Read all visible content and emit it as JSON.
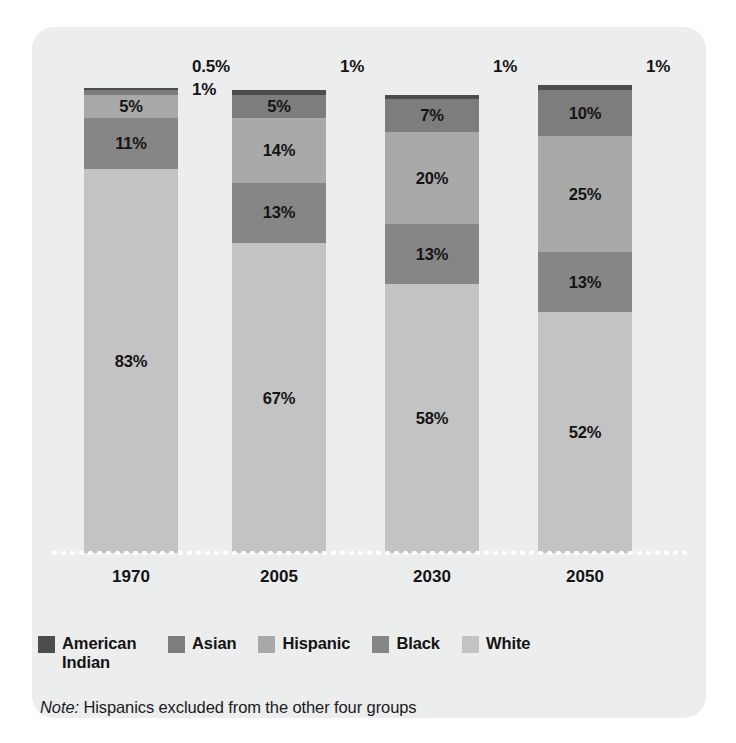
{
  "chart_data": {
    "type": "bar",
    "subtype": "stacked-bar-100-percent",
    "title": "",
    "subtitle": "",
    "xlabel": "",
    "ylabel": "",
    "ylim": [
      0,
      100
    ],
    "grid": false,
    "legend_position": "bottom",
    "categories": [
      "1970",
      "2005",
      "2030",
      "2050"
    ],
    "series": [
      {
        "name": "American Indian",
        "color": "#4c4c4c",
        "values": [
          0.5,
          1,
          1,
          1
        ]
      },
      {
        "name": "Asian",
        "color": "#7d7d7d",
        "values": [
          1,
          5,
          7,
          10
        ]
      },
      {
        "name": "Hispanic",
        "color": "#a9a9a9",
        "values": [
          5,
          14,
          20,
          25
        ]
      },
      {
        "name": "Black",
        "color": "#868686",
        "values": [
          11,
          13,
          13,
          13
        ]
      },
      {
        "name": "White",
        "color": "#c3c3c3",
        "values": [
          83,
          67,
          58,
          52
        ]
      }
    ],
    "note": "Note: Hispanics excluded from the other four groups"
  },
  "colors": {
    "panel_background": "#eceded",
    "page_background": "#ffffff",
    "american_indian": "#4c4c4c",
    "asian": "#7d7d7d",
    "hispanic": "#a9a9a9",
    "black": "#868686",
    "white": "#c3c3c3",
    "text": "#141414",
    "baseline_dots": "#ffffff"
  },
  "bars": [
    {
      "year": "1970",
      "callouts": [
        "0.5%",
        "1%"
      ],
      "segments": [
        {
          "group": "American Indian",
          "value": 0.5,
          "label": "",
          "show_label": false
        },
        {
          "group": "Asian",
          "value": 1,
          "label": "",
          "show_label": false
        },
        {
          "group": "Hispanic",
          "value": 5,
          "label": "5%",
          "show_label": true
        },
        {
          "group": "Black",
          "value": 11,
          "label": "11%",
          "show_label": true
        },
        {
          "group": "White",
          "value": 83,
          "label": "83%",
          "show_label": true
        }
      ]
    },
    {
      "year": "2005",
      "callouts": [
        "1%"
      ],
      "segments": [
        {
          "group": "American Indian",
          "value": 1,
          "label": "",
          "show_label": false
        },
        {
          "group": "Asian",
          "value": 5,
          "label": "5%",
          "show_label": true
        },
        {
          "group": "Hispanic",
          "value": 14,
          "label": "14%",
          "show_label": true
        },
        {
          "group": "Black",
          "value": 13,
          "label": "13%",
          "show_label": true
        },
        {
          "group": "White",
          "value": 67,
          "label": "67%",
          "show_label": true
        }
      ]
    },
    {
      "year": "2030",
      "callouts": [
        "1%"
      ],
      "segments": [
        {
          "group": "American Indian",
          "value": 1,
          "label": "",
          "show_label": false
        },
        {
          "group": "Asian",
          "value": 7,
          "label": "7%",
          "show_label": true
        },
        {
          "group": "Hispanic",
          "value": 20,
          "label": "20%",
          "show_label": true
        },
        {
          "group": "Black",
          "value": 13,
          "label": "13%",
          "show_label": true
        },
        {
          "group": "White",
          "value": 58,
          "label": "58%",
          "show_label": true
        }
      ]
    },
    {
      "year": "2050",
      "callouts": [
        "1%"
      ],
      "segments": [
        {
          "group": "American Indian",
          "value": 1,
          "label": "",
          "show_label": false
        },
        {
          "group": "Asian",
          "value": 10,
          "label": "10%",
          "show_label": true
        },
        {
          "group": "Hispanic",
          "value": 25,
          "label": "25%",
          "show_label": true
        },
        {
          "group": "Black",
          "value": 13,
          "label": "13%",
          "show_label": true
        },
        {
          "group": "White",
          "value": 52,
          "label": "52%",
          "show_label": true
        }
      ]
    }
  ],
  "legend": {
    "items": [
      {
        "label": "American Indian",
        "color": "#4c4c4c"
      },
      {
        "label": "Asian",
        "color": "#7d7d7d"
      },
      {
        "label": "Hispanic",
        "color": "#a9a9a9"
      },
      {
        "label": "Black",
        "color": "#868686"
      },
      {
        "label": "White",
        "color": "#c3c3c3"
      }
    ]
  },
  "note": {
    "prefix": "Note:",
    "text": "Hispanics excluded from the other four groups"
  }
}
